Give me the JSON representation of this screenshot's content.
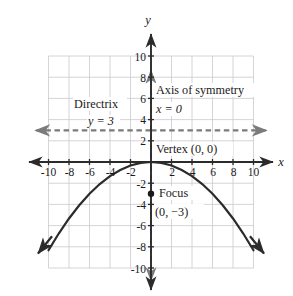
{
  "figure": {
    "label": "f."
  },
  "chart_data": {
    "type": "line",
    "title": "",
    "subtitle": "",
    "xlabel": "x",
    "ylabel": "y",
    "xlim": [
      -11.5,
      11.5
    ],
    "ylim": [
      -11.5,
      11.5
    ],
    "grid": true,
    "grid_extent": {
      "xmin": -10,
      "xmax": 10,
      "ymin": -10,
      "ymax": 10,
      "step": 2
    },
    "legend": "none",
    "xticks": [
      "-10",
      "-8",
      "-6",
      "-4",
      "-2",
      "2",
      "4",
      "6",
      "8",
      "10"
    ],
    "xtick_values": [
      -10,
      -8,
      -6,
      -4,
      -2,
      2,
      4,
      6,
      8,
      10
    ],
    "yticks": [
      "10",
      "8",
      "6",
      "4",
      "2",
      "-2",
      "-4",
      "-6",
      "-8",
      "-10"
    ],
    "ytick_values": [
      10,
      8,
      6,
      4,
      2,
      -2,
      -4,
      -6,
      -8,
      -10
    ],
    "curve": {
      "name": "parabola",
      "equation": "y = -x^2/12",
      "opens": "down",
      "x": [
        -10,
        -9,
        -8,
        -7,
        -6,
        -5,
        -4,
        -3,
        -2,
        -1,
        0,
        1,
        2,
        3,
        4,
        5,
        6,
        7,
        8,
        9,
        10
      ],
      "y": [
        -8.33,
        -6.75,
        -5.33,
        -4.08,
        -3,
        -2.08,
        -1.33,
        -0.75,
        -0.33,
        -0.08,
        0,
        -0.08,
        -0.33,
        -0.75,
        -1.33,
        -2.08,
        -3,
        -4.08,
        -5.33,
        -6.75,
        -8.33
      ],
      "arrows": "both"
    },
    "points": [
      {
        "name": "focus",
        "x": 0,
        "y": -3,
        "marker": "filled-dot"
      }
    ],
    "lines": [
      {
        "name": "directrix",
        "type": "horizontal-dashed",
        "y": 3,
        "arrows": "both",
        "color": "#7b7b7b"
      },
      {
        "name": "axis-of-symmetry",
        "type": "vertical-dashed",
        "x": 0,
        "arrows": "both",
        "color": "#7b7b7b"
      }
    ],
    "annotations": [
      {
        "name": "directrix-label",
        "text": "Directrix",
        "x": -6.6,
        "y": 6.0
      },
      {
        "name": "directrix-equation",
        "text": "y = 3",
        "x": -5.3,
        "y": 4.1
      },
      {
        "name": "axis-of-symmetry-label",
        "text": "Axis of symmetry",
        "x": 0.6,
        "y": 7.1
      },
      {
        "name": "axis-of-symmetry-equation",
        "text": "x = 0",
        "x": 0.6,
        "y": 5.3
      },
      {
        "name": "vertex-label",
        "text": "Vertex (0, 0)",
        "x": 0.6,
        "y": 1.6
      },
      {
        "name": "focus-label",
        "text": "Focus",
        "x": 1.0,
        "y": -2.6
      },
      {
        "name": "focus-coordinates",
        "text": "(0, −3)",
        "x": 0.5,
        "y": -4.3
      }
    ]
  },
  "colors": {
    "grid": "#c9c9cf",
    "axis": "#2b2b2b",
    "curve": "#2b2b2b",
    "dashed": "#7b7b7b",
    "text": "#1a1a1a",
    "background": "#ffffff"
  }
}
